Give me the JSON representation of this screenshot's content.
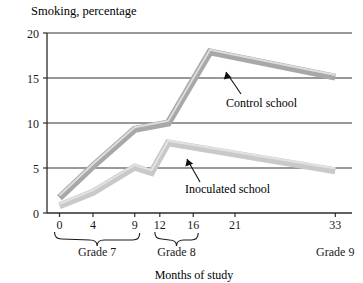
{
  "figure": {
    "title": "Smoking, percentage",
    "xlabel": "Months of study",
    "annotations": {
      "control": "Control school",
      "inoculated": "Inoculated school"
    },
    "grade_brackets": [
      {
        "label": "Grade 7",
        "from": 0,
        "to": 9
      },
      {
        "label": "Grade 8",
        "from": 12,
        "to": 16
      },
      {
        "label": "Grade 9",
        "from": 33,
        "to": 33
      }
    ],
    "colors": {
      "control_line": "#a8a8a8",
      "inoculated_line": "#c9c9c9",
      "axis": "#2b2b2b",
      "grid": "#333333",
      "text": "#1a1a1a",
      "background": "#ffffff"
    }
  },
  "chart_data": {
    "type": "line",
    "title": "Smoking, percentage",
    "xlabel": "Months of study",
    "ylabel": "Smoking, percentage",
    "xlim": [
      -1.5,
      35
    ],
    "ylim": [
      0,
      20
    ],
    "xticks": [
      0,
      4,
      9,
      12,
      16,
      21,
      33
    ],
    "xticklabels": [
      "0",
      "4",
      "9",
      "12",
      "16",
      "21",
      "33"
    ],
    "yticks": [
      0,
      5,
      10,
      15,
      20
    ],
    "yticklabels": [
      "0",
      "5",
      "10",
      "15",
      "20"
    ],
    "grid": "horizontal",
    "legend": "inline-annotations",
    "series": [
      {
        "name": "Control school",
        "color": "#a8a8a8",
        "x": [
          0,
          4,
          9,
          13,
          18,
          33
        ],
        "values": [
          1.7,
          5.2,
          9.3,
          10.0,
          17.9,
          15.1
        ]
      },
      {
        "name": "Inoculated school",
        "color": "#c9c9c9",
        "x": [
          0,
          4,
          9,
          11,
          13,
          33
        ],
        "values": [
          0.8,
          2.3,
          5.1,
          4.5,
          7.8,
          4.7
        ]
      }
    ]
  }
}
